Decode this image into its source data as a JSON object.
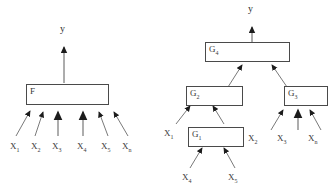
{
  "figure": {
    "background_color": "#ffffff",
    "ink_color": "#3a3a3a",
    "box_stroke_color": "#4a4a4a"
  },
  "left_diagram": {
    "name": "flat-function-model",
    "output_label": "y",
    "function_box": {
      "label_text": "F",
      "label_base": "F",
      "label_sub": ""
    },
    "inputs": [
      {
        "base": "X",
        "sub": "1",
        "text": "X1"
      },
      {
        "base": "X",
        "sub": "2",
        "text": "X2"
      },
      {
        "base": "X",
        "sub": "3",
        "text": "X3"
      },
      {
        "base": "X",
        "sub": "4",
        "text": "X4"
      },
      {
        "base": "X",
        "sub": "5",
        "text": "X5"
      },
      {
        "base": "X",
        "sub": "n",
        "text": "Xn"
      }
    ]
  },
  "right_diagram": {
    "name": "decomposed-function-model",
    "output_label": "y",
    "boxes": [
      {
        "id": "g4",
        "label_base": "G",
        "label_sub": "4"
      },
      {
        "id": "g2",
        "label_base": "G",
        "label_sub": "2"
      },
      {
        "id": "g3",
        "label_base": "G",
        "label_sub": "3"
      },
      {
        "id": "g1",
        "label_base": "G",
        "label_sub": "1"
      }
    ],
    "inputs": [
      {
        "id": "x1",
        "base": "X",
        "sub": "1",
        "text": "X1"
      },
      {
        "id": "x2",
        "base": "X",
        "sub": "2",
        "text": "X2"
      },
      {
        "id": "x3",
        "base": "X",
        "sub": "3",
        "text": "X3"
      },
      {
        "id": "xn",
        "base": "X",
        "sub": "n",
        "text": "Xn"
      },
      {
        "id": "x4",
        "base": "X",
        "sub": "4",
        "text": "X4"
      },
      {
        "id": "x5",
        "base": "X",
        "sub": "5",
        "text": "X5"
      }
    ]
  }
}
